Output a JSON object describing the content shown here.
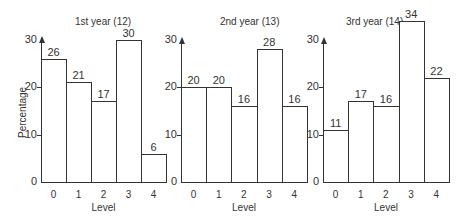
{
  "chart_data": [
    {
      "type": "bar",
      "title": "1st year (12)",
      "xlabel": "Level",
      "ylabel": "Percentage",
      "categories": [
        "0",
        "1",
        "2",
        "3",
        "4"
      ],
      "values": [
        26,
        21,
        17,
        30,
        6
      ],
      "yticks": [
        "0",
        "10",
        "20",
        "30"
      ],
      "ylim": [
        0,
        30
      ],
      "grid": false
    },
    {
      "type": "bar",
      "title": "2nd year (13)",
      "xlabel": "Level",
      "ylabel": "",
      "categories": [
        "0",
        "1",
        "2",
        "3",
        "4"
      ],
      "values": [
        20,
        20,
        16,
        28,
        16
      ],
      "yticks": [
        "0",
        "10",
        "20",
        "30"
      ],
      "ylim": [
        0,
        30
      ],
      "grid": false
    },
    {
      "type": "bar",
      "title": "3rd year (14)",
      "xlabel": "Level",
      "ylabel": "",
      "categories": [
        "0",
        "1",
        "2",
        "3",
        "4"
      ],
      "values": [
        11,
        17,
        16,
        34,
        22
      ],
      "yticks": [
        "0",
        "10",
        "20",
        "30"
      ],
      "ylim": [
        0,
        34
      ],
      "grid": false
    }
  ],
  "colors": {
    "line": "#333333",
    "bar_fill": "#ffffff"
  }
}
